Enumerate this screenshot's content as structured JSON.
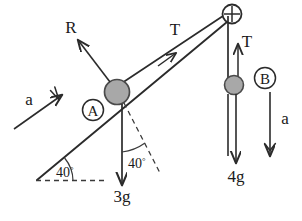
{
  "diagram": {
    "colors": {
      "line": "#2b2b2b",
      "block_fill": "#a8a8a8",
      "block_stroke": "#4a4a4a",
      "text": "#1a1a1a",
      "background": "#ffffff"
    },
    "incline": {
      "angle_label": "40",
      "angle_degree_symbol": "°"
    },
    "blocks": [
      {
        "name": "block-a",
        "label": "A",
        "weight_label": "3g"
      },
      {
        "name": "block-b",
        "label": "B",
        "weight_label": "4g"
      }
    ],
    "forces": [
      {
        "name": "normal-reaction",
        "label": "R"
      },
      {
        "name": "tension-incline",
        "label": "T"
      },
      {
        "name": "tension-hanging",
        "label": "T"
      },
      {
        "name": "weight-a",
        "label": "3g"
      },
      {
        "name": "weight-b",
        "label": "4g"
      }
    ],
    "accelerations": [
      {
        "name": "acceleration-a",
        "label": "a"
      },
      {
        "name": "acceleration-b",
        "label": "a"
      }
    ],
    "angles": [
      {
        "name": "incline-base-angle",
        "value": "40",
        "unit": "°"
      },
      {
        "name": "weight-incline-angle",
        "value": "40",
        "unit": "°"
      }
    ],
    "pulley": {
      "name": "pulley",
      "glyph": "+"
    }
  }
}
